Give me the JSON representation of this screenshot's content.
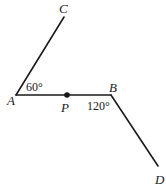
{
  "diagram": {
    "points": {
      "A": {
        "label": "A",
        "x": 16,
        "y": 95
      },
      "B": {
        "label": "B",
        "x": 111,
        "y": 95
      },
      "C": {
        "label": "C",
        "x": 64,
        "y": 17
      },
      "D": {
        "label": "D",
        "x": 158,
        "y": 166
      },
      "P": {
        "label": "P",
        "x": 67,
        "y": 95
      }
    },
    "segments": [
      {
        "from": "A",
        "to": "C"
      },
      {
        "from": "A",
        "to": "B"
      },
      {
        "from": "B",
        "to": "D"
      }
    ],
    "angles": {
      "at_A": "60°",
      "at_B": "120°"
    },
    "colors": {
      "ink": "#1a1a1a",
      "background": "#ffffff"
    }
  }
}
